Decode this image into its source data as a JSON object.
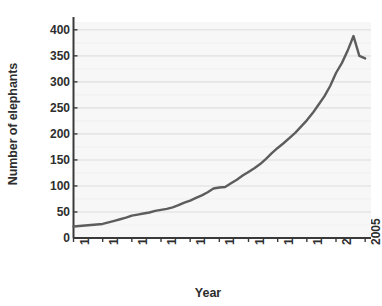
{
  "chart_data": {
    "type": "line",
    "title": "",
    "xlabel": "Year",
    "ylabel": "Number of elephants",
    "xlim": [
      1955,
      2006
    ],
    "ylim": [
      0,
      415
    ],
    "xticks": [
      1955,
      1960,
      1965,
      1970,
      1975,
      1980,
      1985,
      1990,
      1995,
      2000,
      2005
    ],
    "xtick_labels": [
      "1955",
      "1960",
      "1965",
      "1970",
      "1975",
      "1980",
      "1985",
      "1990",
      "1995",
      "2000",
      "2005"
    ],
    "yticks": [
      0,
      50,
      100,
      150,
      200,
      250,
      300,
      350,
      400
    ],
    "ytick_labels": [
      "0",
      "50",
      "100",
      "150",
      "200",
      "250",
      "300",
      "350",
      "400"
    ],
    "grid": "horizontal",
    "legend": "none",
    "line_color": "#5d5d5d",
    "line_width": 2.4,
    "plot_bg": "#f7f7f7",
    "axis_color": "#3a3a3a",
    "series": [
      {
        "name": "Number of elephants",
        "x": [
          1955,
          1956,
          1957,
          1958,
          1959,
          1960,
          1961,
          1962,
          1963,
          1964,
          1965,
          1966,
          1967,
          1968,
          1969,
          1970,
          1971,
          1972,
          1973,
          1974,
          1975,
          1976,
          1977,
          1978,
          1979,
          1980,
          1981,
          1982,
          1983,
          1984,
          1985,
          1986,
          1987,
          1988,
          1989,
          1990,
          1991,
          1992,
          1993,
          1994,
          1995,
          1996,
          1997,
          1998,
          1999,
          2000,
          2001,
          2002,
          2003,
          2004,
          2005
        ],
        "values": [
          22,
          23,
          24,
          25,
          26,
          27,
          30,
          33,
          36,
          39,
          43,
          45,
          47,
          49,
          52,
          54,
          56,
          59,
          63,
          68,
          72,
          77,
          82,
          88,
          95,
          97,
          98,
          105,
          112,
          120,
          127,
          134,
          142,
          152,
          163,
          173,
          182,
          192,
          202,
          214,
          226,
          240,
          256,
          272,
          292,
          317,
          336,
          360,
          388,
          350,
          345
        ]
      }
    ]
  },
  "axis_title_x": "Year",
  "axis_title_y": "Number of elephants"
}
